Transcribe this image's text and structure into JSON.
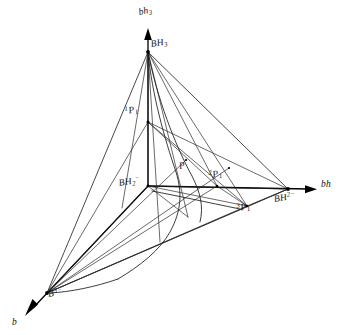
{
  "figure": {
    "background_color": "#ffffff",
    "line_color": "#1b1b1b",
    "width": 345,
    "height": 335
  },
  "axes": [
    {
      "key": "vertical",
      "label": "bh3",
      "label_html": "bh<sub>3</sub>",
      "base_text": "bh",
      "sub_text": "3",
      "direction": "up",
      "origin": [
        148,
        186
      ],
      "tip": [
        148,
        32
      ]
    },
    {
      "key": "horizontal",
      "label": "bh",
      "label_html": "bh",
      "base_text": "bh",
      "sub_text": "",
      "direction": "right",
      "origin": [
        148,
        186
      ],
      "tip": [
        315,
        189
      ]
    },
    {
      "key": "depth",
      "label": "b",
      "label_html": "b",
      "base_text": "b",
      "sub_text": "",
      "direction": "down-left",
      "origin": [
        148,
        186
      ],
      "tip": [
        24,
        317
      ]
    }
  ],
  "vertices": [
    {
      "id": "BH3",
      "label": "BH3",
      "base_text": "BH",
      "sub_text": "3",
      "sup_text": "",
      "x": 148,
      "y": 52,
      "label_x": 152,
      "label_y": 44
    },
    {
      "id": "BH2-",
      "label": "BH2-",
      "base_text": "BH",
      "sub_text": "2",
      "sup_text": "−",
      "x": 148,
      "y": 186,
      "label_x": 122,
      "label_y": 180
    },
    {
      "id": "BH2-minus",
      "label": "BH2-",
      "base_text": "BH",
      "sub_text": "",
      "sup_text": "2−",
      "x": 288,
      "y": 189,
      "label_x": 277,
      "label_y": 194
    },
    {
      "id": "B3-",
      "label": "B3-",
      "base_text": "B",
      "sub_text": "",
      "sup_text": "3−",
      "x": 47,
      "y": 293,
      "label_x": 48,
      "label_y": 292
    }
  ],
  "points": [
    {
      "id": "1P1",
      "label": "1P1",
      "pre_sup_text": "1",
      "base_text": "P",
      "sub_text": "1",
      "x": 148,
      "y": 122,
      "label_x": 127,
      "label_y": 109
    },
    {
      "id": "2P1",
      "label": "2P1",
      "pre_sup_text": "2",
      "base_text": "P",
      "sub_text": "1",
      "x": 217,
      "y": 186,
      "label_x": 213,
      "label_y": 172
    },
    {
      "id": "3P1",
      "label": "3P1",
      "pre_sup_text": "3",
      "base_text": "P",
      "sub_text": "1",
      "x": 247,
      "y": 206,
      "label_x": 240,
      "label_y": 205
    },
    {
      "id": "P",
      "label": "P",
      "pre_sup_text": "",
      "base_text": "P",
      "sub_text": "",
      "x": 180,
      "y": 180,
      "label_x": 180,
      "label_y": 163
    }
  ]
}
